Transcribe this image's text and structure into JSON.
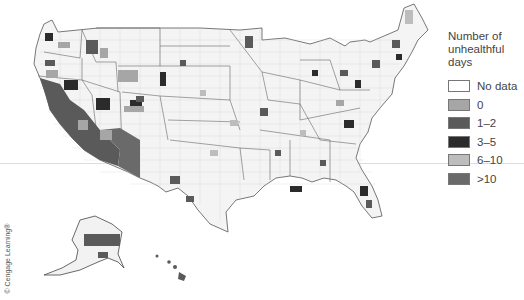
{
  "legend": {
    "title_lines": [
      "Number of",
      "unhealthful",
      "days"
    ],
    "items": [
      {
        "label": "No data",
        "color": "#ffffff"
      },
      {
        "label": "0",
        "color": "#a6a6a6"
      },
      {
        "label": "1–2",
        "color": "#5a5a5a"
      },
      {
        "label": "3–5",
        "color": "#2b2b2b"
      },
      {
        "label": "6–10",
        "color": "#bdbdbd"
      },
      {
        "label": ">10",
        "color": "#6a6a6a"
      }
    ]
  },
  "credit": "© Cengage Learning®",
  "map": {
    "region": "United States (counties), including Alaska and Hawaii insets",
    "style": "grayscale choropleth"
  }
}
